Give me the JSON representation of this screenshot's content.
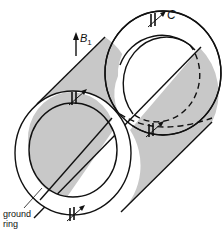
{
  "diagram": {
    "labels": {
      "field": "B",
      "field_sub": "1",
      "capacitor": "C",
      "ground_ring_line1": "ground",
      "ground_ring_line2": "ring"
    },
    "colors": {
      "line": "#111111",
      "shade": "#c8c8c8",
      "background": "#ffffff"
    },
    "components": [
      "back ring",
      "front ring",
      "cylinder shell (shaded half)",
      "4 capacitors",
      "ground ring",
      "B1 field arrow"
    ]
  }
}
